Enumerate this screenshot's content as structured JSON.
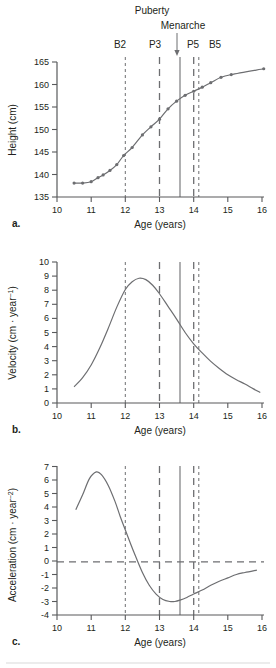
{
  "figure": {
    "annotations": {
      "puberty_label": "Puberty",
      "menarche_label": "Menarche",
      "stage_b2": "B2",
      "stage_p3": "P3",
      "stage_p5": "P5",
      "stage_b5": "B5"
    },
    "markers": [
      {
        "name": "B2",
        "age": 12.0,
        "style": "dashed-fine"
      },
      {
        "name": "P3",
        "age": 13.0,
        "style": "dashed-long"
      },
      {
        "name": "Menarche",
        "age": 13.6,
        "style": "solid"
      },
      {
        "name": "P5",
        "age": 14.0,
        "style": "dashed-long"
      },
      {
        "name": "B5",
        "age": 14.15,
        "style": "dashed-fine"
      }
    ],
    "panels": [
      {
        "letter": "a.",
        "xlabel": "Age (years)",
        "ylabel": "Height (cm)"
      },
      {
        "letter": "b.",
        "xlabel": "Age (years)",
        "ylabel_main": "Velocity (cm · year",
        "ylabel_sup": "−1",
        "ylabel_tail": ")"
      },
      {
        "letter": "c.",
        "xlabel": "Age (years)",
        "ylabel_main": "Acceleration (cm · year",
        "ylabel_sup": "−2",
        "ylabel_tail": ")"
      }
    ]
  },
  "chart_data": [
    {
      "type": "line",
      "panel": "a",
      "title": "",
      "xlabel": "Age (years)",
      "ylabel": "Height (cm)",
      "xlim": [
        10,
        16
      ],
      "ylim": [
        135,
        165
      ],
      "xticks": [
        10,
        11,
        12,
        13,
        14,
        15,
        16
      ],
      "yticks": [
        135,
        140,
        145,
        150,
        155,
        160,
        165
      ],
      "grid": false,
      "legend": "none",
      "markers_shown": true,
      "x": [
        10.5,
        10.75,
        11.0,
        11.2,
        11.35,
        11.55,
        11.75,
        11.95,
        12.2,
        12.5,
        12.75,
        13.0,
        13.25,
        13.5,
        13.75,
        14.0,
        14.25,
        14.5,
        14.8,
        15.1,
        16.05
      ],
      "values": [
        138.1,
        138.1,
        138.4,
        139.3,
        139.9,
        140.9,
        142.2,
        144.2,
        146.0,
        148.8,
        150.6,
        152.3,
        154.6,
        156.3,
        157.6,
        158.5,
        159.4,
        160.4,
        161.6,
        162.2,
        163.5
      ]
    },
    {
      "type": "line",
      "panel": "b",
      "title": "",
      "xlabel": "Age (years)",
      "ylabel": "Velocity (cm · year−1)",
      "xlim": [
        10,
        16
      ],
      "ylim": [
        0,
        10
      ],
      "xticks": [
        10,
        11,
        12,
        13,
        14,
        15,
        16
      ],
      "yticks": [
        0,
        1,
        2,
        3,
        4,
        5,
        6,
        7,
        8,
        9,
        10
      ],
      "grid": false,
      "legend": "none",
      "markers_shown": false,
      "x": [
        10.5,
        10.75,
        11.0,
        11.25,
        11.5,
        11.75,
        12.0,
        12.2,
        12.4,
        12.6,
        12.8,
        13.0,
        13.25,
        13.5,
        13.75,
        14.0,
        14.25,
        14.5,
        14.75,
        15.0,
        15.25,
        15.5,
        15.75,
        15.95
      ],
      "values": [
        1.15,
        1.8,
        2.7,
        3.9,
        5.3,
        6.8,
        8.05,
        8.6,
        8.85,
        8.75,
        8.35,
        7.75,
        6.85,
        5.95,
        5.0,
        4.2,
        3.55,
        2.95,
        2.45,
        2.0,
        1.65,
        1.35,
        1.0,
        0.75
      ]
    },
    {
      "type": "line",
      "panel": "c",
      "title": "",
      "xlabel": "Age (years)",
      "ylabel": "Acceleration (cm · year−2)",
      "xlim": [
        10,
        16
      ],
      "ylim": [
        -4,
        7
      ],
      "xticks": [
        10,
        11,
        12,
        13,
        14,
        15,
        16
      ],
      "yticks": [
        -4,
        -3,
        -2,
        -1,
        0,
        1,
        2,
        3,
        4,
        5,
        6,
        7
      ],
      "grid": false,
      "zero_line": 0,
      "legend": "none",
      "markers_shown": false,
      "x": [
        10.55,
        10.75,
        10.95,
        11.15,
        11.3,
        11.5,
        11.7,
        11.85,
        12.0,
        12.15,
        12.3,
        12.5,
        12.7,
        12.9,
        13.1,
        13.3,
        13.45,
        13.6,
        13.8,
        14.0,
        14.25,
        14.5,
        14.75,
        15.0,
        15.25,
        15.5,
        15.85
      ],
      "values": [
        3.8,
        4.9,
        6.1,
        6.6,
        6.4,
        5.6,
        4.4,
        3.3,
        2.3,
        1.3,
        0.35,
        -0.85,
        -1.8,
        -2.45,
        -2.85,
        -3.0,
        -3.0,
        -2.9,
        -2.7,
        -2.45,
        -2.15,
        -1.8,
        -1.5,
        -1.25,
        -1.0,
        -0.85,
        -0.67
      ]
    }
  ]
}
